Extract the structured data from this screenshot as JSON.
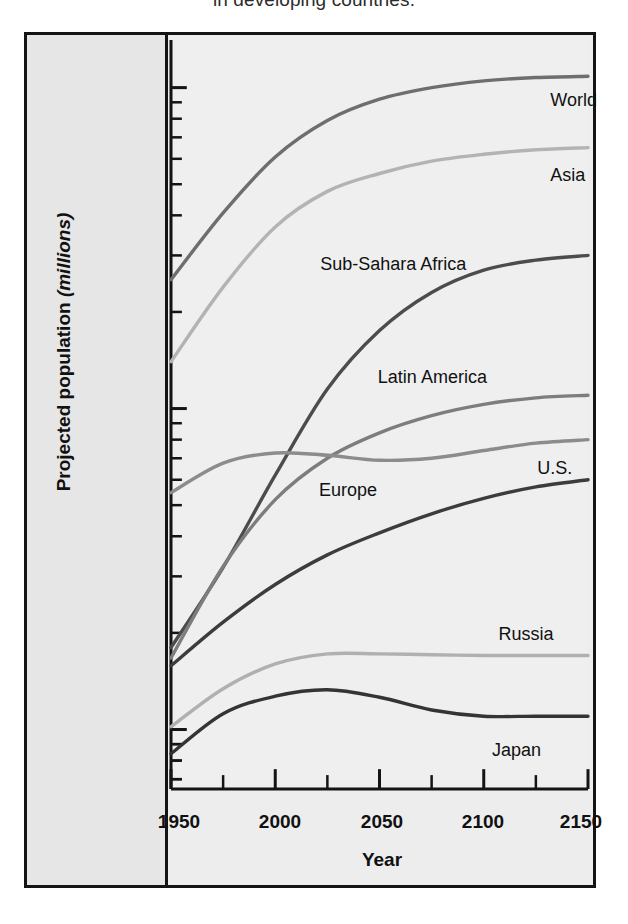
{
  "caption": "in developing countries.",
  "chart_data": {
    "type": "line",
    "title": "",
    "xlabel": "Year",
    "ylabel": "Projected population (millions)",
    "ylabel_plain": "Projected population",
    "ylabel_italic": "(millions)",
    "yscale": "log",
    "ylim": [
      60,
      20000
    ],
    "ytick_labels": [
      "10,000",
      "1,000",
      "100"
    ],
    "ytick_values": [
      10000,
      1000,
      100
    ],
    "xlim": [
      1950,
      2150
    ],
    "xtick_labels": [
      "1950",
      "2000",
      "2050",
      "2100",
      "2150"
    ],
    "xtick_values": [
      1950,
      2000,
      2050,
      2100,
      2150
    ],
    "xminor_step": 25,
    "grid": false,
    "legend": "inline-labels",
    "x": [
      1950,
      1975,
      2000,
      2025,
      2050,
      2075,
      2100,
      2125,
      2150
    ],
    "series": [
      {
        "name": "World",
        "color": "#6e6e6e",
        "values": [
          2520,
          4070,
          6080,
          7900,
          9200,
          10000,
          10500,
          10750,
          10850
        ]
      },
      {
        "name": "Asia",
        "color": "#b3b3b3",
        "values": [
          1400,
          2390,
          3680,
          4750,
          5400,
          5900,
          6200,
          6400,
          6500
        ]
      },
      {
        "name": "Sub-Sahara Africa",
        "color": "#4c4c4c",
        "values": [
          180,
          320,
          620,
          1150,
          1750,
          2300,
          2700,
          2900,
          3000
        ]
      },
      {
        "name": "Latin America",
        "color": "#7d7d7d",
        "values": [
          167,
          322,
          520,
          700,
          840,
          950,
          1030,
          1080,
          1100
        ]
      },
      {
        "name": "Europe",
        "color": "#8c8c8c",
        "values": [
          547,
          676,
          727,
          715,
          690,
          700,
          740,
          780,
          800
        ]
      },
      {
        "name": "U.S.",
        "color": "#3c3c3c",
        "values": [
          158,
          216,
          283,
          350,
          410,
          470,
          525,
          570,
          600
        ]
      },
      {
        "name": "Russia",
        "color": "#b0b0b0",
        "values": [
          102,
          134,
          160,
          172,
          172,
          171,
          170,
          170,
          170
        ]
      },
      {
        "name": "Japan",
        "color": "#343434",
        "values": [
          84,
          112,
          127,
          133,
          126,
          115,
          110,
          110,
          110
        ]
      }
    ],
    "annotations": [
      {
        "text": "World",
        "at_year": 2125,
        "position": "below-right"
      },
      {
        "text": "Asia",
        "at_year": 2125,
        "position": "below-right"
      },
      {
        "text": "Sub-Sahara Africa",
        "at_year": 2070,
        "position": "above"
      },
      {
        "text": "Latin America",
        "at_year": 2085,
        "position": "above"
      },
      {
        "text": "Europe",
        "at_year": 2040,
        "position": "below"
      },
      {
        "text": "U.S.",
        "at_year": 2115,
        "position": "above-right"
      },
      {
        "text": "Russia",
        "at_year": 2110,
        "position": "above"
      },
      {
        "text": "Japan",
        "at_year": 2105,
        "position": "below"
      }
    ]
  }
}
